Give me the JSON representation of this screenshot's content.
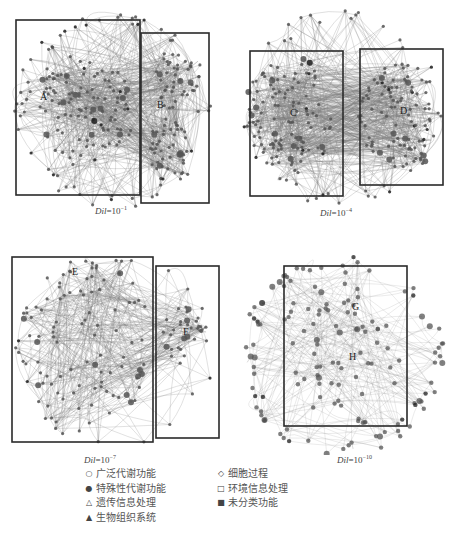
{
  "panels": [
    {
      "id": "p1",
      "caption_var": "Dil",
      "caption_eq": "=10",
      "caption_exp": "−1",
      "boxes": [
        {
          "label": "A"
        },
        {
          "label": "B"
        }
      ],
      "density": "dense"
    },
    {
      "id": "p2",
      "caption_var": "Dil",
      "caption_eq": "=10",
      "caption_exp": "−4",
      "boxes": [
        {
          "label": "C"
        },
        {
          "label": "D"
        }
      ],
      "density": "dense"
    },
    {
      "id": "p3",
      "caption_var": "Dil",
      "caption_eq": "=10",
      "caption_exp": "−7",
      "boxes": [
        {
          "label": "E"
        },
        {
          "label": "F"
        }
      ],
      "density": "medium"
    },
    {
      "id": "p4",
      "caption_var": "Dil",
      "caption_eq": "=10",
      "caption_exp": "−10",
      "boxes": [
        {
          "label": "G"
        },
        {
          "label": "H"
        }
      ],
      "density": "sparse"
    }
  ],
  "legend": {
    "left": [
      {
        "symbol": "○",
        "icon": "open-circle-icon",
        "label": "广泛代谢功能"
      },
      {
        "symbol": "●",
        "icon": "filled-circle-icon",
        "label": "特殊性代谢功能"
      },
      {
        "symbol": "△",
        "icon": "open-triangle-icon",
        "label": "遗传信息处理"
      },
      {
        "symbol": "▲",
        "icon": "filled-triangle-icon",
        "label": "生物组织系统"
      }
    ],
    "right": [
      {
        "symbol": "◇",
        "icon": "open-diamond-icon",
        "label": "细胞过程"
      },
      {
        "symbol": "□",
        "icon": "open-square-icon",
        "label": "环境信息处理"
      },
      {
        "symbol": "■",
        "icon": "filled-square-icon",
        "label": "未分类功能"
      }
    ]
  },
  "colors": {
    "edge": "#7a7a7a",
    "node": "#555555",
    "node_dark": "#1e1e1e",
    "box": "#2a2a2a"
  }
}
